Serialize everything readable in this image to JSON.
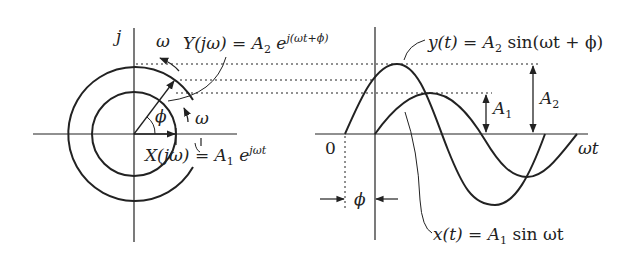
{
  "figure": {
    "phasor": {
      "imag_axis_label": "j",
      "omega_outer_label": "ω",
      "omega_inner_label": "ω",
      "phi_label": "ϕ",
      "Y_label_main": "Y(jω) = A",
      "Y_label_sub": "2",
      "Y_label_e": " e",
      "Y_label_sup": "j(ωt+ϕ)",
      "X_label_main": "X(jω) = A",
      "X_label_sub": "1",
      "X_label_e": " e",
      "X_label_sup": "jωt"
    },
    "waveform": {
      "y_label_main": "y(t) = A",
      "y_label_sub": "2",
      "y_label_rest": " sin(ωt + ϕ)",
      "x_label_main": "x(t) = A",
      "x_label_sub": "1",
      "x_label_rest": " sin ωt",
      "time_axis_label": "ωt",
      "origin_label": "0",
      "phase_label": "ϕ",
      "A1_label": "A",
      "A1_sub": "1",
      "A2_label": "A",
      "A2_sub": "2"
    },
    "colors": {
      "ink": "#222222",
      "background": "#ffffff"
    }
  }
}
